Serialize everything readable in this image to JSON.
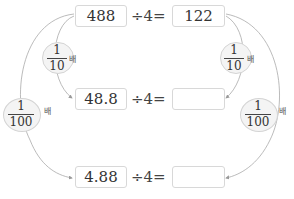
{
  "rows": [
    {
      "dividend": "488",
      "operator": "÷4=",
      "result": "122"
    },
    {
      "dividend": "48.8",
      "operator": "÷4=",
      "result": ""
    },
    {
      "dividend": "4.88",
      "operator": "÷4=",
      "result": ""
    }
  ],
  "left_labels": [
    {
      "numerator": "1",
      "denominator": "10",
      "suffix": "배"
    },
    {
      "numerator": "1",
      "denominator": "100",
      "suffix": "배"
    }
  ],
  "right_labels": [
    {
      "numerator": "1",
      "denominator": "10",
      "suffix": "배"
    },
    {
      "numerator": "1",
      "denominator": "100",
      "suffix": "배"
    }
  ],
  "colors": {
    "line": "#aaaaaa",
    "box_border": "#d8d8d8",
    "ellipse_fill": "#f4f4f4"
  }
}
